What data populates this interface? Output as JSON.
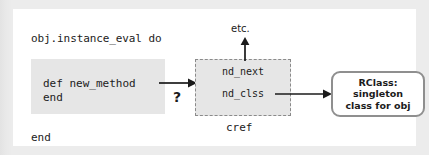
{
  "figure": {
    "colors": {
      "page_background": "#e9e9e9",
      "card_background": "#ffffff",
      "code_block_fill": "#e6e6e6",
      "cref_fill": "#e6e6e6",
      "cref_border": "#8a8a8a",
      "rclass_border": "#8f8f8f",
      "text": "#1b1b1b"
    }
  },
  "code": {
    "open_line": "obj.instance_eval do",
    "body_line_1": "def new_method",
    "body_line_2": "end",
    "close_line": "end"
  },
  "transition": {
    "question_mark": "?",
    "arrow_icon": "arrow-right"
  },
  "cref": {
    "caption": "cref",
    "fields": [
      {
        "label": "nd_next"
      },
      {
        "label": "nd_clss"
      }
    ]
  },
  "etc": {
    "label": "etc.",
    "arrow_icon": "arrow-up"
  },
  "rclass": {
    "line_1": "RClass:",
    "line_2": "singleton",
    "line_3": "class for obj"
  }
}
